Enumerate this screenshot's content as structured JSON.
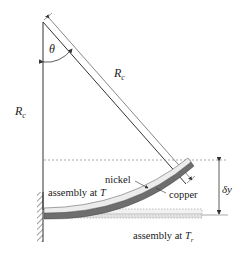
{
  "diagram": {
    "labels": {
      "theta": "θ",
      "rc_diagonal_main": "R",
      "rc_diagonal_sub": "c",
      "rc_vertical_main": "R",
      "rc_vertical_sub": "c",
      "nickel": "nickel",
      "copper": "copper",
      "assembly_T": "assembly at T",
      "assembly_Tr_main": "assembly at T",
      "assembly_Tr_sub": "r",
      "delta_y": "δy"
    },
    "colors": {
      "line": "#333333",
      "nickel": "#e4e4e4",
      "copper": "#6e6e6e",
      "dashed": "#888888"
    }
  }
}
